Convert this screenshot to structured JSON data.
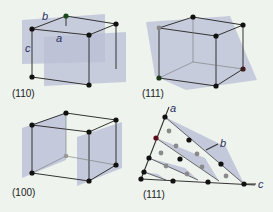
{
  "figure": {
    "background": "#eef3ee",
    "plane_color": "#b9bfd6",
    "edge_color": "#333333",
    "atom_color": "#111111",
    "panels": [
      {
        "id": "top-left",
        "miller_index": "(110)",
        "axis_labels": {
          "a": "a",
          "b": "b",
          "c": "c"
        }
      },
      {
        "id": "top-right",
        "miller_index": "(111)"
      },
      {
        "id": "bottom-left",
        "miller_index": "(100)"
      },
      {
        "id": "bottom-right",
        "miller_index": "(111)",
        "axis_labels": {
          "a": "a",
          "b": "b",
          "c": "c"
        }
      }
    ]
  }
}
